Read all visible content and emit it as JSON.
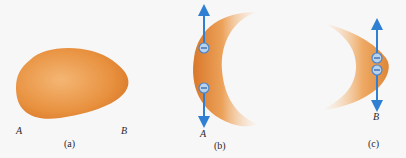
{
  "panels": [
    {
      "caption": "(a)",
      "description": "uncharged egg-shaped conductor",
      "labels": [
        "A",
        "B"
      ]
    },
    {
      "caption": "(b)",
      "description": "region near end A with two negative charges and force arrows along surface",
      "labels": [
        "A"
      ],
      "charges": [
        "−",
        "−"
      ]
    },
    {
      "caption": "(c)",
      "description": "region near end B with two negative charges and force arrows along surface",
      "labels": [
        "B"
      ],
      "charges": [
        "−",
        "−"
      ]
    }
  ],
  "colors": {
    "conductor": "#e8913f",
    "conductor_light": "#f8d6ae",
    "arrow": "#2f7fd3",
    "charge_fill": "#b9d3ee",
    "charge_stroke": "#4a86c9",
    "background": "#f7f7f8"
  }
}
